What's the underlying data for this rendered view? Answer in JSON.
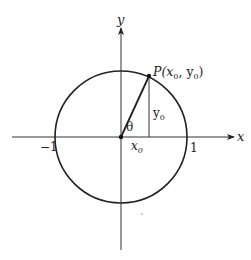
{
  "diagram": {
    "axes": {
      "x_label": "x",
      "y_label": "y"
    },
    "ticks": {
      "neg_one": "−1",
      "pos_one": "1"
    },
    "point_label": {
      "prefix": "P(",
      "x": "x",
      "x_sub": "0",
      "sep": ", ",
      "y": "y",
      "y_sub": "0",
      "suffix": ")"
    },
    "angle_label": "θ",
    "segment_labels": {
      "x0": {
        "base": "x",
        "sub": "0"
      },
      "y0": {
        "base": "y",
        "sub": "0"
      }
    },
    "colors": {
      "stroke": "#222222",
      "background": "#ffffff"
    }
  }
}
